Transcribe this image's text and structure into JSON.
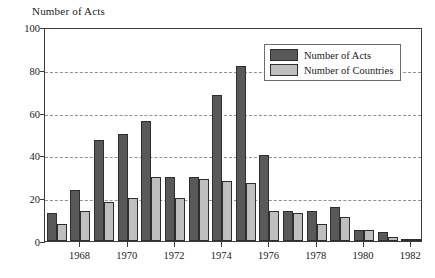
{
  "chart_data": {
    "type": "bar",
    "title": "Number of Acts",
    "xlabel": "",
    "ylabel": "Number of Acts",
    "ylim": [
      0,
      100
    ],
    "yticks": [
      0,
      20,
      40,
      60,
      80,
      100
    ],
    "grid": true,
    "legend_position": "top-right",
    "categories": [
      "1967",
      "1968",
      "1969",
      "1970",
      "1971",
      "1972",
      "1973",
      "1974",
      "1975",
      "1976",
      "1977",
      "1978",
      "1979",
      "1980",
      "1981",
      "1982"
    ],
    "xtick_labels": [
      "1968",
      "1970",
      "1972",
      "1974",
      "1976",
      "1978",
      "1980",
      "1982"
    ],
    "series": [
      {
        "name": "Number of Acts",
        "color": "#595959",
        "values": [
          13,
          24,
          47,
          50,
          56,
          30,
          30,
          68,
          82,
          40,
          14,
          14,
          16,
          5,
          4,
          1
        ]
      },
      {
        "name": "Number of Countries",
        "color": "#bfbfbf",
        "values": [
          8,
          14,
          18,
          20,
          30,
          20,
          29,
          28,
          27,
          14,
          13,
          8,
          11,
          5,
          2,
          1
        ]
      }
    ]
  },
  "legend": {
    "items": [
      {
        "label": "Number of Acts",
        "swatch": "acts"
      },
      {
        "label": "Number of Countries",
        "swatch": "countries"
      }
    ]
  },
  "colors": {
    "acts": "#595959",
    "countries": "#bfbfbf",
    "axis": "#3d3d3d",
    "grid": "#8f8f9e",
    "background": "#ffffff"
  }
}
